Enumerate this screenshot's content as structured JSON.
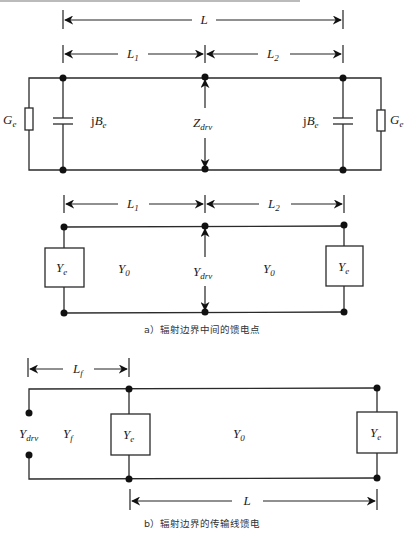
{
  "figure_a": {
    "caption": "a）辐射边界中间的馈电点",
    "top_circuit": {
      "dim_total": {
        "label": "L"
      },
      "dim_left": {
        "label": "L",
        "sub": "1"
      },
      "dim_right": {
        "label": "L",
        "sub": "2"
      },
      "left_conductance": {
        "label": "G",
        "sub": "e"
      },
      "left_susceptance": {
        "prefix": "j",
        "label": "B",
        "sub": "e"
      },
      "drive_impedance": {
        "label": "Z",
        "sub": "drv"
      },
      "right_susceptance": {
        "prefix": "j",
        "label": "B",
        "sub": "e"
      },
      "right_conductance": {
        "label": "G",
        "sub": "e"
      }
    },
    "bottom_circuit": {
      "dim_left": {
        "label": "L",
        "sub": "1"
      },
      "dim_right": {
        "label": "L",
        "sub": "2"
      },
      "left_admittance": {
        "label": "Y",
        "sub": "e"
      },
      "left_line": {
        "label": "Y",
        "sub": "0"
      },
      "drive_admittance": {
        "label": "Y",
        "sub": "drv"
      },
      "right_line": {
        "label": "Y",
        "sub": "0"
      },
      "right_admittance": {
        "label": "Y",
        "sub": "e"
      }
    }
  },
  "figure_b": {
    "caption": "b）辐射边界的传输线馈电",
    "dim_feed": {
      "label": "L",
      "sub": "f"
    },
    "dim_total": {
      "label": "L"
    },
    "drive_admittance": {
      "label": "Y",
      "sub": "drv"
    },
    "feed_line": {
      "label": "Y",
      "sub": "f"
    },
    "left_admittance": {
      "label": "Y",
      "sub": "e"
    },
    "main_line": {
      "label": "Y",
      "sub": "0"
    },
    "right_admittance": {
      "label": "Y",
      "sub": "e"
    }
  }
}
